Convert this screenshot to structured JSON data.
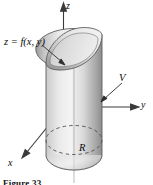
{
  "figure": {
    "kind": "3d-solid-diagram",
    "background_color": "#ffffff",
    "caption": "Figure 33",
    "labels": {
      "surface_function": "z = f(x, y)",
      "axis_z": "z",
      "axis_y": "y",
      "axis_x": "x",
      "volume": "V",
      "region": "R"
    },
    "colors": {
      "ink": "#0a0a0a",
      "outline": "#4a4a4a",
      "solid_light": "#f2f2f2",
      "solid_mid": "#c9c9c9",
      "solid_dark": "#8e8e8e",
      "cap_light": "#ebebeb",
      "cap_dark": "#a8a8a8",
      "dashed": "#555555"
    },
    "axes": [
      {
        "name": "z",
        "direction": "up",
        "arrow": true
      },
      {
        "name": "y",
        "direction": "right",
        "arrow": true
      },
      {
        "name": "x",
        "direction": "down-left",
        "arrow": true
      }
    ],
    "annotations": [
      {
        "name": "surface-leader",
        "text": "z = f(x, y)",
        "points_to": "top-curved-surface"
      },
      {
        "name": "volume-leader",
        "text": "V",
        "points_to": "solid-body"
      },
      {
        "name": "region-label",
        "text": "R",
        "points_to": "base-region"
      }
    ]
  }
}
